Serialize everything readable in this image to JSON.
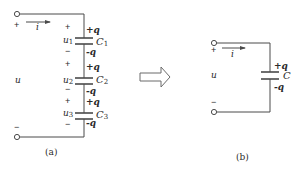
{
  "figure": {
    "colors": {
      "line": "#4a4a4a",
      "text": "#2a2a2a",
      "background": "#ffffff"
    },
    "circuit_a": {
      "caption": "(a)",
      "voltage_label": "u",
      "current_label": "i",
      "terminal_top_polarity": "+",
      "terminal_bottom_polarity": "−",
      "capacitors": [
        {
          "name": "C",
          "subscript": "1",
          "voltage_name": "u",
          "voltage_subscript": "1",
          "plus_sign": "+",
          "minus_sign": "−",
          "top_charge": "+q",
          "bottom_charge": "-q"
        },
        {
          "name": "C",
          "subscript": "2",
          "voltage_name": "u",
          "voltage_subscript": "2",
          "plus_sign": "+",
          "minus_sign": "−",
          "top_charge": "+q",
          "bottom_charge": "-q"
        },
        {
          "name": "C",
          "subscript": "3",
          "voltage_name": "u",
          "voltage_subscript": "3",
          "plus_sign": "+",
          "minus_sign": "−",
          "top_charge": "+q",
          "bottom_charge": "-q"
        }
      ]
    },
    "equivalence_arrow": "hollow-right-arrow",
    "circuit_b": {
      "caption": "(b)",
      "voltage_label": "u",
      "current_label": "i",
      "terminal_top_polarity": "+",
      "terminal_bottom_polarity": "−",
      "capacitor": {
        "name": "C",
        "top_charge": "+q",
        "bottom_charge": "-q"
      }
    }
  }
}
